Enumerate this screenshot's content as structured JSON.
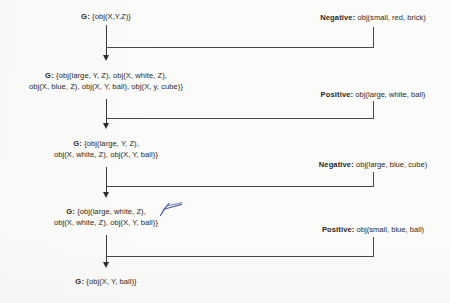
{
  "diagram": {
    "type": "flow-trace",
    "ink_color": "#2b2926",
    "annotation_color": "#4a5fa8",
    "nodes": [
      {
        "id": "g0",
        "label_prefix": "G:",
        "lines": [
          "{obj(X,Y,Z)}"
        ]
      },
      {
        "id": "g1",
        "label_prefix": "G:",
        "lines": [
          "{obj(large, Y, Z), obj(X, white, Z),",
          "obj(X, blue, Z), obj(X, Y, ball), obj(X, y, cube)}"
        ]
      },
      {
        "id": "g2",
        "label_prefix": "G:",
        "lines": [
          "{obj(large, Y, Z),",
          "obj(X, white, Z), obj(X, Y, ball)}"
        ]
      },
      {
        "id": "g3",
        "label_prefix": "G:",
        "lines": [
          "{obj(large, white, Z),",
          "obj(X, white, Z), obj(X, Y, ball)}"
        ]
      },
      {
        "id": "g4",
        "label_prefix": "G:",
        "lines": [
          "{obj(X, Y, ball)}"
        ]
      }
    ],
    "examples": [
      {
        "id": "e0",
        "tag": "Negative:",
        "value": "obj(small, red, brick)"
      },
      {
        "id": "e1",
        "tag": "Positive:",
        "value": "obj(large, white, ball)"
      },
      {
        "id": "e2",
        "tag": "Negative:",
        "value": "obj(large, blue, cube)"
      },
      {
        "id": "e3",
        "tag": "Positive:",
        "value": "obj(small, blue, ball)"
      }
    ],
    "annotation": {
      "kind": "blue-pen-stroke",
      "near": "g3-line-1"
    }
  }
}
